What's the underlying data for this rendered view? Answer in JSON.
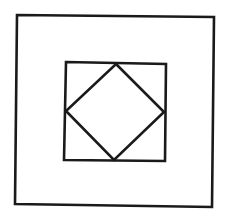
{
  "canvas": {
    "width": 227,
    "height": 222,
    "background": "#ffffff"
  },
  "style": {
    "stroke": "#1a1a1a",
    "stroke_width": 2.6
  },
  "shapes": {
    "outer_square": {
      "points": "17,15 214,17 212,207 15,204"
    },
    "inner_square": {
      "points": "66,62 166,64 165,161 64,160"
    },
    "diamond": {
      "points": "116,64 164,112 114,160 66,111"
    }
  }
}
